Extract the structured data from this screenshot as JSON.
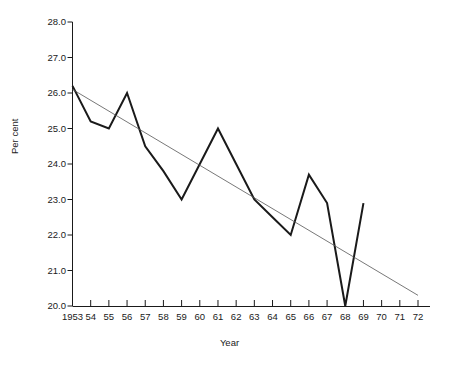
{
  "chart_data": {
    "type": "line",
    "title": "",
    "xlabel": "Year",
    "ylabel": "Per cent",
    "xlim": [
      1953,
      1972
    ],
    "ylim": [
      20.0,
      28.0
    ],
    "grid": false,
    "legend": "none",
    "x_tick_labels": [
      "1953",
      "54",
      "55",
      "56",
      "57",
      "58",
      "59",
      "60",
      "61",
      "62",
      "63",
      "64",
      "65",
      "66",
      "67",
      "68",
      "69",
      "70",
      "71",
      "72"
    ],
    "x": [
      1953,
      1954,
      1955,
      1956,
      1957,
      1958,
      1959,
      1960,
      1961,
      1962,
      1963,
      1964,
      1965,
      1966,
      1967,
      1968,
      1969,
      1970,
      1971,
      1972
    ],
    "y_tick_labels": [
      "20.0",
      "21.0",
      "22.0",
      "23.0",
      "24.0",
      "25.0",
      "26.0",
      "27.0",
      "28.0"
    ],
    "y_ticks": [
      20.0,
      21.0,
      22.0,
      23.0,
      24.0,
      25.0,
      26.0,
      27.0,
      28.0
    ],
    "series": [
      {
        "name": "Per cent",
        "type": "line",
        "color": "#1a1a1a",
        "width": 2.0,
        "x": [
          1953,
          1954,
          1955,
          1956,
          1957,
          1958,
          1959,
          1960,
          1961,
          1962,
          1963,
          1964,
          1965,
          1966,
          1967,
          1968,
          1969
        ],
        "values": [
          26.2,
          25.2,
          25.0,
          26.0,
          24.5,
          23.8,
          23.0,
          24.0,
          25.0,
          24.0,
          23.0,
          22.5,
          22.0,
          23.7,
          22.9,
          20.0,
          22.9
        ]
      },
      {
        "name": "Trend line",
        "type": "line",
        "color": "#555555",
        "width": 0.8,
        "x": [
          1953,
          1972
        ],
        "values": [
          26.1,
          20.3
        ]
      }
    ]
  },
  "axis": {
    "y_axis_name": "per-cent-axis",
    "x_axis_name": "year-axis"
  }
}
